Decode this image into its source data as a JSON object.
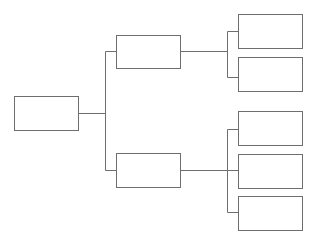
{
  "diagram": {
    "type": "tree",
    "orientation": "left-to-right",
    "colors": {
      "stroke": "#6e6e6e",
      "fill": "#ffffff",
      "background": "#ffffff"
    },
    "nodes": [
      {
        "id": "root",
        "label": "",
        "level": 0,
        "x": 14,
        "y": 96,
        "w": 64,
        "h": 34
      },
      {
        "id": "branch-1",
        "label": "",
        "level": 1,
        "parent": "root",
        "x": 116,
        "y": 35,
        "w": 64,
        "h": 33
      },
      {
        "id": "branch-2",
        "label": "",
        "level": 1,
        "parent": "root",
        "x": 116,
        "y": 153,
        "w": 64,
        "h": 34
      },
      {
        "id": "leaf-1-1",
        "label": "",
        "level": 2,
        "parent": "branch-1",
        "x": 238,
        "y": 14,
        "w": 64,
        "h": 34
      },
      {
        "id": "leaf-1-2",
        "label": "",
        "level": 2,
        "parent": "branch-1",
        "x": 238,
        "y": 57,
        "w": 64,
        "h": 34
      },
      {
        "id": "leaf-2-1",
        "label": "",
        "level": 2,
        "parent": "branch-2",
        "x": 238,
        "y": 111,
        "w": 64,
        "h": 34
      },
      {
        "id": "leaf-2-2",
        "label": "",
        "level": 2,
        "parent": "branch-2",
        "x": 238,
        "y": 154,
        "w": 64,
        "h": 34
      },
      {
        "id": "leaf-2-3",
        "label": "",
        "level": 2,
        "parent": "branch-2",
        "x": 238,
        "y": 196,
        "w": 64,
        "h": 34
      }
    ]
  }
}
